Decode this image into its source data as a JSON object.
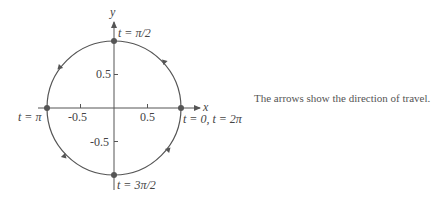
{
  "diagram": {
    "type": "parametric-unit-circle",
    "center": [
      0,
      0
    ],
    "radius": 1,
    "axes": {
      "x_label": "x",
      "y_label": "y"
    },
    "ticks": {
      "x": [
        "-0.5",
        "0.5"
      ],
      "y": [
        "0.5",
        "-0.5"
      ]
    },
    "points": [
      {
        "label": "t = π/2",
        "x": 0,
        "y": 1
      },
      {
        "label": "t = π",
        "x": -1,
        "y": 0
      },
      {
        "label": "t = 0, t = 2π",
        "x": 1,
        "y": 0
      },
      {
        "label": "t = 3π/2",
        "x": 0,
        "y": -1
      }
    ],
    "direction": "counterclockwise",
    "colors": {
      "curve": "#555555",
      "point": "#555555",
      "axis": "#555555"
    }
  },
  "caption": "The arrows show the direction of travel."
}
